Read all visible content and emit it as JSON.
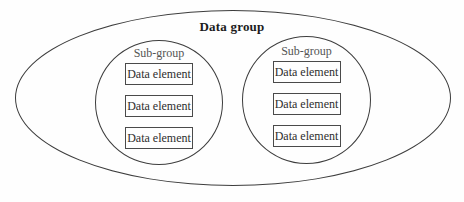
{
  "diagram": {
    "title": "Data group",
    "subgroups": [
      {
        "label": "Sub-group",
        "elements": [
          "Data element",
          "Data element",
          "Data element"
        ]
      },
      {
        "label": "Sub-group",
        "elements": [
          "Data element",
          "Data element",
          "Data element"
        ]
      }
    ],
    "colors": {
      "stroke": "#3d3d3d",
      "title_text": "#1c1c1c",
      "subgroup_label_text": "#545454",
      "element_text": "#2e2e2e",
      "background": "#fefefe"
    }
  }
}
